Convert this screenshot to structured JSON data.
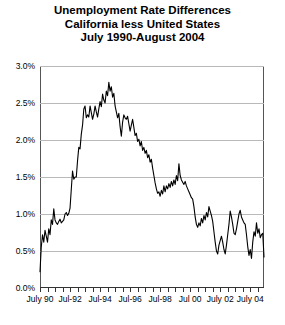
{
  "chart_data": {
    "type": "line",
    "title": "Unemployment Rate Differences",
    "subtitle": "California less United States",
    "subtitle2": "July 1990-August 2004",
    "title_lines": [
      "Unemployment Rate Differences",
      "California less United States",
      "July 1990-August 2004"
    ],
    "xlabel": "",
    "ylabel": "",
    "ylim": [
      0.0,
      3.0
    ],
    "ytick_labels": [
      "0.0%",
      "0.5%",
      "1.0%",
      "1.5%",
      "2.0%",
      "2.5%",
      "3.0%"
    ],
    "ytick_values": [
      0.0,
      0.5,
      1.0,
      1.5,
      2.0,
      2.5,
      3.0
    ],
    "xtick_labels": [
      "July 90",
      "Jul-92",
      "Jul-94",
      "Jul-96",
      "Jul-98",
      "Jul 00",
      "July 02",
      "July 04"
    ],
    "xtick_index": [
      0,
      24,
      48,
      72,
      96,
      120,
      144,
      168
    ],
    "grid": true,
    "legend": "none",
    "series_name": "California less United States unemployment rate difference",
    "x_start": "July 1990",
    "x_end": "August 2004",
    "n_points": 170,
    "units": "percentage points",
    "values": [
      0.22,
      0.55,
      0.72,
      0.62,
      0.78,
      0.7,
      0.62,
      0.8,
      0.72,
      0.92,
      0.86,
      1.07,
      0.92,
      0.88,
      0.86,
      0.9,
      0.93,
      0.88,
      0.9,
      0.92,
      1.0,
      1.02,
      0.98,
      1.01,
      1.08,
      1.33,
      1.58,
      1.47,
      1.5,
      1.5,
      1.72,
      1.9,
      1.88,
      2.08,
      2.2,
      2.42,
      2.46,
      2.3,
      2.34,
      2.31,
      2.46,
      2.37,
      2.28,
      2.35,
      2.46,
      2.38,
      2.31,
      2.42,
      2.52,
      2.45,
      2.62,
      2.54,
      2.5,
      2.66,
      2.6,
      2.78,
      2.66,
      2.72,
      2.58,
      2.63,
      2.46,
      2.38,
      2.3,
      2.36,
      2.18,
      2.05,
      2.24,
      2.34,
      2.3,
      2.28,
      2.32,
      2.22,
      2.12,
      2.2,
      2.28,
      2.17,
      2.06,
      2.09,
      1.98,
      2.01,
      1.92,
      1.98,
      1.86,
      1.9,
      1.82,
      1.86,
      1.76,
      1.8,
      1.7,
      1.74,
      1.62,
      1.52,
      1.42,
      1.34,
      1.28,
      1.3,
      1.24,
      1.32,
      1.27,
      1.38,
      1.3,
      1.38,
      1.34,
      1.41,
      1.36,
      1.44,
      1.38,
      1.46,
      1.4,
      1.52,
      1.45,
      1.68,
      1.52,
      1.46,
      1.43,
      1.4,
      1.44,
      1.38,
      1.34,
      1.3,
      1.26,
      1.22,
      1.2,
      1.1,
      0.96,
      0.86,
      0.82,
      0.88,
      0.84,
      0.94,
      0.88,
      0.98,
      0.92,
      1.02,
      0.96,
      1.1,
      1.04,
      0.98,
      0.9,
      0.76,
      0.62,
      0.5,
      0.46,
      0.58,
      0.64,
      0.7,
      0.62,
      0.52,
      0.46,
      0.58,
      0.72,
      0.86,
      1.04,
      0.96,
      0.86,
      0.74,
      0.72,
      0.8,
      0.9,
      1.0,
      1.05,
      0.96,
      0.92,
      0.88,
      0.86,
      0.72,
      0.56,
      0.44,
      0.52,
      0.4,
      0.62,
      0.76,
      0.7,
      0.88,
      0.74,
      0.8,
      0.68,
      0.72,
      0.74,
      0.42
    ]
  }
}
